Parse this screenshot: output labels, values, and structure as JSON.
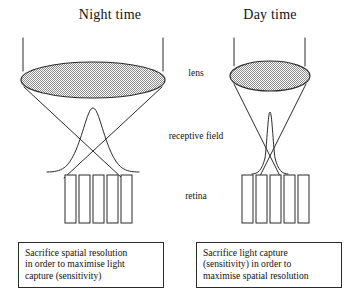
{
  "figure": {
    "background_color": "#ffffff",
    "ink_color": "#2b2b2b",
    "lens_fill_color": "#c9c9c9"
  },
  "panels": {
    "night": {
      "title": "Night time",
      "caption_lines": [
        "Sacrifice spatial resolution",
        "in order to maximise light",
        "capture (sensitivity)"
      ],
      "lens_width_px": 222,
      "receptor_count": 5,
      "receptive_field_width_receptors": 3,
      "pupil_state": "wide"
    },
    "day": {
      "title": "Day time",
      "caption_lines": [
        "Sacrifice light capture",
        "(sensitivity) in order to",
        "maximise spatial resolution"
      ],
      "lens_width_px": 82,
      "receptor_count": 5,
      "receptive_field_width_receptors": 1,
      "pupil_state": "narrow"
    }
  },
  "center_labels": {
    "lens": "lens",
    "receptive_field_line1": "receptive",
    "receptive_field_line2": "field",
    "retina": "retina"
  }
}
